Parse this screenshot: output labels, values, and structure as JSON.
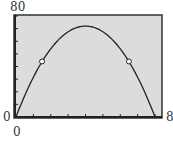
{
  "chart_data": {
    "type": "line",
    "title": "",
    "xlabel": "",
    "ylabel": "",
    "xlim": [
      0,
      8
    ],
    "ylim": [
      0,
      80
    ],
    "x_ticks_step": 1,
    "y_ticks_step": 10,
    "tick_labels": {
      "y_max": "80",
      "y_min": "0",
      "x_min": "0",
      "x_max": "8"
    },
    "series": [
      {
        "name": "curve",
        "x": [
          0,
          1,
          1.5,
          2,
          3,
          4,
          5,
          6,
          6.5,
          7,
          8
        ],
        "values": [
          0,
          31.5,
          43.9,
          54,
          67.5,
          72,
          67.5,
          54,
          43.9,
          31.5,
          0
        ]
      }
    ],
    "open_points": [
      {
        "x": 1.5,
        "y": 44
      },
      {
        "x": 6.5,
        "y": 44
      }
    ],
    "grid": false
  }
}
